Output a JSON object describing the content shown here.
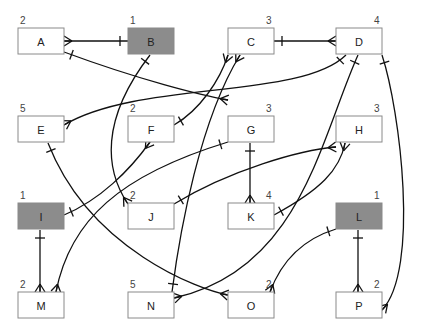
{
  "colors": {
    "normal_fill": "#ffffff",
    "highlight_fill": "#8c8c8c",
    "line": "#111111"
  },
  "entities": [
    {
      "id": "A",
      "label": "A",
      "count": "2",
      "highlighted": false
    },
    {
      "id": "B",
      "label": "B",
      "count": "1",
      "highlighted": true
    },
    {
      "id": "C",
      "label": "C",
      "count": "3",
      "highlighted": false
    },
    {
      "id": "D",
      "label": "D",
      "count": "4",
      "highlighted": false
    },
    {
      "id": "E",
      "label": "E",
      "count": "5",
      "highlighted": false
    },
    {
      "id": "F",
      "label": "F",
      "count": "2",
      "highlighted": false
    },
    {
      "id": "G",
      "label": "G",
      "count": "3",
      "highlighted": false
    },
    {
      "id": "H",
      "label": "H",
      "count": "3",
      "highlighted": false
    },
    {
      "id": "I",
      "label": "I",
      "count": "1",
      "highlighted": true
    },
    {
      "id": "J",
      "label": "J",
      "count": "2",
      "highlighted": false
    },
    {
      "id": "K",
      "label": "K",
      "count": "4",
      "highlighted": false
    },
    {
      "id": "L",
      "label": "L",
      "count": "1",
      "highlighted": true
    },
    {
      "id": "M",
      "label": "M",
      "count": "2",
      "highlighted": false
    },
    {
      "id": "N",
      "label": "N",
      "count": "5",
      "highlighted": false
    },
    {
      "id": "O",
      "label": "O",
      "count": "2",
      "highlighted": false
    },
    {
      "id": "P",
      "label": "P",
      "count": "2",
      "highlighted": false
    }
  ],
  "relationships": [
    {
      "from": "B",
      "to": "A",
      "from_end": "one",
      "to_end": "many"
    },
    {
      "from": "C",
      "to": "D",
      "from_end": "one",
      "to_end": "many"
    },
    {
      "from": "A",
      "to": "G",
      "from_end": "one",
      "to_end": "many"
    },
    {
      "from": "B",
      "to": "J",
      "from_end": "one",
      "to_end": "many"
    },
    {
      "from": "D",
      "to": "E",
      "from_end": "one",
      "to_end": "many"
    },
    {
      "from": "F",
      "to": "C",
      "from_end": "one",
      "to_end": "many"
    },
    {
      "from": "N",
      "to": "C",
      "from_end": "one",
      "to_end": "many"
    },
    {
      "from": "D",
      "to": "N",
      "from_end": "one",
      "to_end": "many"
    },
    {
      "from": "D",
      "to": "P",
      "from_end": "one",
      "to_end": "many"
    },
    {
      "from": "I",
      "to": "F",
      "from_end": "one",
      "to_end": "many"
    },
    {
      "from": "G",
      "to": "K",
      "from_end": "one",
      "to_end": "many"
    },
    {
      "from": "G",
      "to": "M",
      "from_end": "one",
      "to_end": "many"
    },
    {
      "from": "J",
      "to": "H",
      "from_end": "one",
      "to_end": "many"
    },
    {
      "from": "K",
      "to": "H",
      "from_end": "one",
      "to_end": "many"
    },
    {
      "from": "E",
      "to": "O",
      "from_end": "one",
      "to_end": "many"
    },
    {
      "from": "I",
      "to": "M",
      "from_end": "one",
      "to_end": "many"
    },
    {
      "from": "L",
      "to": "O",
      "from_end": "one",
      "to_end": "many"
    },
    {
      "from": "L",
      "to": "P",
      "from_end": "one",
      "to_end": "many"
    }
  ]
}
